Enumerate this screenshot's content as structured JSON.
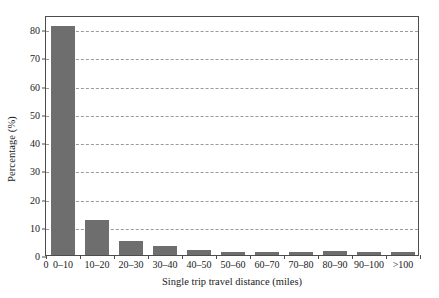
{
  "chart_data": {
    "type": "bar",
    "title": "",
    "xlabel": "Single trip travel distance (miles)",
    "ylabel": "Percentage (%)",
    "categories": [
      "0–10",
      "10–20",
      "20–30",
      "30–40",
      "40–50",
      "50–60",
      "60–70",
      "70–80",
      "80–90",
      "90–100",
      ">100"
    ],
    "values": [
      81.0,
      12.3,
      4.8,
      3.3,
      1.8,
      1.2,
      1.0,
      0.9,
      1.3,
      0.9,
      0.9
    ],
    "ylim": [
      0,
      85
    ],
    "yticks": [
      0,
      10,
      20,
      30,
      40,
      50,
      60,
      70,
      80
    ],
    "ytick_labels": [
      "0",
      "10",
      "20",
      "30",
      "40",
      "50",
      "60",
      "70",
      "80"
    ],
    "xtick_origin_label": "0",
    "grid": "horizontal-dashed",
    "legend": "none",
    "bar_color": "#6e6e6e",
    "grid_color": "#9a9a9a",
    "axis_color": "#4d4d4d",
    "background": "#ffffff"
  }
}
